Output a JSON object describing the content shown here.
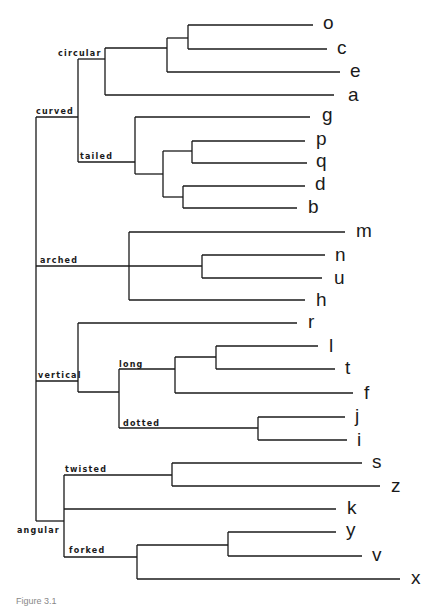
{
  "diagram": {
    "type": "dendrogram",
    "caption": "Figure 3.1",
    "groups": {
      "curved": "curved",
      "circular": "circular",
      "tailed": "tailed",
      "arched": "arched",
      "vertical": "vertical",
      "long": "long",
      "dotted": "dotted",
      "angular": "angular",
      "twisted": "twisted",
      "forked": "forked"
    },
    "leaves": [
      "o",
      "c",
      "e",
      "a",
      "g",
      "p",
      "q",
      "d",
      "b",
      "m",
      "n",
      "u",
      "h",
      "r",
      "l",
      "t",
      "f",
      "j",
      "i",
      "s",
      "z",
      "k",
      "y",
      "v",
      "x"
    ],
    "structure": {
      "curved": {
        "circular": [
          [
            [
              "o",
              "c"
            ],
            "e"
          ],
          "a"
        ],
        "tailed": [
          "g",
          [
            [
              "p",
              "q"
            ],
            [
              "d",
              "b"
            ]
          ]
        ]
      },
      "arched": [
        "m",
        [
          "n",
          "u"
        ],
        "h"
      ],
      "vertical": [
        "r",
        {
          "long": [
            [
              "l",
              "t"
            ],
            "f"
          ],
          "dotted": [
            "j",
            "i"
          ]
        }
      ],
      "angular": {
        "twisted": [
          "s",
          "z"
        ],
        "other": "k",
        "forked": [
          [
            "y",
            "v"
          ],
          "x"
        ]
      }
    }
  }
}
